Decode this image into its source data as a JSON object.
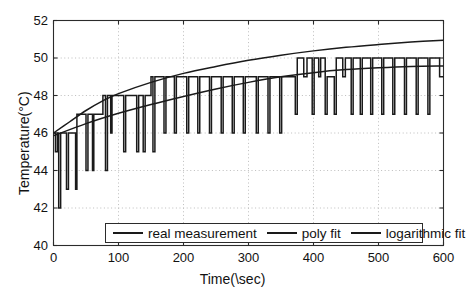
{
  "chart_data": {
    "type": "line",
    "title": "",
    "xlabel": "Time(\\sec)",
    "ylabel": "Temperature(°C)",
    "xlim": [
      0,
      600
    ],
    "ylim": [
      40,
      52
    ],
    "xticks": [
      "0",
      "100",
      "200",
      "300",
      "400",
      "500",
      "600"
    ],
    "xtick_values": [
      0,
      100,
      200,
      300,
      400,
      500,
      600
    ],
    "yticks": [
      "40",
      "42",
      "44",
      "46",
      "48",
      "50",
      "52"
    ],
    "ytick_values": [
      40,
      42,
      44,
      46,
      48,
      50,
      52
    ],
    "grid": "dotted both axes",
    "legend_position": "lower center inside axes",
    "series": [
      {
        "name": "real measurement",
        "color": "#1a1a1a",
        "style": "square-wave with downward spikes",
        "points": [
          [
            0,
            46.0
          ],
          [
            3,
            46.0
          ],
          [
            3,
            45.0
          ],
          [
            6,
            45.0
          ],
          [
            6,
            46.0
          ],
          [
            8,
            46.0
          ],
          [
            8,
            42.0
          ],
          [
            11,
            42.0
          ],
          [
            11,
            46.0
          ],
          [
            20,
            46.0
          ],
          [
            20,
            43.0
          ],
          [
            23,
            43.0
          ],
          [
            23,
            46.0
          ],
          [
            34,
            46.0
          ],
          [
            34,
            43.0
          ],
          [
            36,
            43.0
          ],
          [
            36,
            47.0
          ],
          [
            44,
            47.0
          ],
          [
            44,
            47.0
          ],
          [
            50,
            47.0
          ],
          [
            50,
            44.0
          ],
          [
            53,
            44.0
          ],
          [
            53,
            47.0
          ],
          [
            60,
            47.0
          ],
          [
            60,
            44.0
          ],
          [
            62,
            44.0
          ],
          [
            62,
            47.0
          ],
          [
            72,
            47.0
          ],
          [
            72,
            47.0
          ],
          [
            76,
            47.0
          ],
          [
            76,
            48.0
          ],
          [
            80,
            48.0
          ],
          [
            80,
            44.0
          ],
          [
            83,
            44.0
          ],
          [
            83,
            48.0
          ],
          [
            88,
            48.0
          ],
          [
            88,
            46.0
          ],
          [
            90,
            46.0
          ],
          [
            90,
            48.0
          ],
          [
            100,
            48.0
          ],
          [
            100,
            48.0
          ],
          [
            108,
            48.0
          ],
          [
            108,
            45.0
          ],
          [
            111,
            45.0
          ],
          [
            111,
            48.0
          ],
          [
            120,
            48.0
          ],
          [
            120,
            48.0
          ],
          [
            128,
            48.0
          ],
          [
            128,
            45.0
          ],
          [
            131,
            45.0
          ],
          [
            131,
            48.0
          ],
          [
            138,
            48.0
          ],
          [
            138,
            45.0
          ],
          [
            141,
            45.0
          ],
          [
            141,
            48.0
          ],
          [
            150,
            48.0
          ],
          [
            150,
            49.0
          ],
          [
            153,
            49.0
          ],
          [
            153,
            45.0
          ],
          [
            156,
            45.0
          ],
          [
            156,
            49.0
          ],
          [
            163,
            49.0
          ],
          [
            163,
            49.0
          ],
          [
            170,
            49.0
          ],
          [
            170,
            46.0
          ],
          [
            173,
            46.0
          ],
          [
            173,
            49.0
          ],
          [
            186,
            49.0
          ],
          [
            186,
            46.0
          ],
          [
            189,
            46.0
          ],
          [
            189,
            49.0
          ],
          [
            205,
            49.0
          ],
          [
            205,
            46.0
          ],
          [
            208,
            46.0
          ],
          [
            208,
            49.0
          ],
          [
            222,
            49.0
          ],
          [
            222,
            46.0
          ],
          [
            225,
            46.0
          ],
          [
            225,
            49.0
          ],
          [
            240,
            49.0
          ],
          [
            240,
            46.0
          ],
          [
            243,
            46.0
          ],
          [
            243,
            49.0
          ],
          [
            258,
            49.0
          ],
          [
            258,
            46.0
          ],
          [
            261,
            46.0
          ],
          [
            261,
            49.0
          ],
          [
            275,
            49.0
          ],
          [
            275,
            46.0
          ],
          [
            278,
            46.0
          ],
          [
            278,
            49.0
          ],
          [
            292,
            49.0
          ],
          [
            292,
            46.0
          ],
          [
            295,
            46.0
          ],
          [
            295,
            49.0
          ],
          [
            312,
            49.0
          ],
          [
            312,
            46.0
          ],
          [
            315,
            46.0
          ],
          [
            315,
            49.0
          ],
          [
            330,
            49.0
          ],
          [
            330,
            46.0
          ],
          [
            333,
            46.0
          ],
          [
            333,
            49.0
          ],
          [
            348,
            49.0
          ],
          [
            348,
            46.0
          ],
          [
            351,
            46.0
          ],
          [
            351,
            49.0
          ],
          [
            372,
            49.0
          ],
          [
            372,
            47.0
          ],
          [
            375,
            47.0
          ],
          [
            375,
            50.0
          ],
          [
            385,
            50.0
          ],
          [
            385,
            49.0
          ],
          [
            390,
            49.0
          ],
          [
            390,
            50.0
          ],
          [
            398,
            50.0
          ],
          [
            398,
            47.0
          ],
          [
            401,
            47.0
          ],
          [
            401,
            50.0
          ],
          [
            408,
            50.0
          ],
          [
            408,
            49.0
          ],
          [
            411,
            49.0
          ],
          [
            411,
            50.0
          ],
          [
            418,
            50.0
          ],
          [
            418,
            47.0
          ],
          [
            421,
            47.0
          ],
          [
            421,
            49.0
          ],
          [
            432,
            49.0
          ],
          [
            432,
            47.0
          ],
          [
            435,
            47.0
          ],
          [
            435,
            50.0
          ],
          [
            445,
            50.0
          ],
          [
            445,
            49.0
          ],
          [
            449,
            49.0
          ],
          [
            449,
            50.0
          ],
          [
            458,
            50.0
          ],
          [
            458,
            47.0
          ],
          [
            461,
            47.0
          ],
          [
            461,
            50.0
          ],
          [
            472,
            50.0
          ],
          [
            472,
            47.0
          ],
          [
            475,
            47.0
          ],
          [
            475,
            50.0
          ],
          [
            488,
            50.0
          ],
          [
            488,
            47.0
          ],
          [
            491,
            47.0
          ],
          [
            491,
            50.0
          ],
          [
            505,
            50.0
          ],
          [
            505,
            47.0
          ],
          [
            508,
            47.0
          ],
          [
            508,
            50.0
          ],
          [
            522,
            50.0
          ],
          [
            522,
            47.0
          ],
          [
            525,
            47.0
          ],
          [
            525,
            50.0
          ],
          [
            540,
            50.0
          ],
          [
            540,
            47.0
          ],
          [
            543,
            47.0
          ],
          [
            543,
            50.0
          ],
          [
            558,
            50.0
          ],
          [
            558,
            47.0
          ],
          [
            561,
            47.0
          ],
          [
            561,
            50.0
          ],
          [
            576,
            50.0
          ],
          [
            576,
            47.0
          ],
          [
            579,
            47.0
          ],
          [
            579,
            50.0
          ],
          [
            594,
            50.0
          ],
          [
            594,
            49.0
          ],
          [
            600,
            49.0
          ]
        ]
      },
      {
        "name": "poly fit",
        "color": "#1a1a1a",
        "style": "smooth near-linear",
        "points": [
          [
            0,
            45.85
          ],
          [
            50,
            46.5
          ],
          [
            100,
            47.05
          ],
          [
            150,
            47.52
          ],
          [
            200,
            47.95
          ],
          [
            250,
            48.35
          ],
          [
            300,
            48.7
          ],
          [
            350,
            49.0
          ],
          [
            400,
            49.22
          ],
          [
            450,
            49.38
          ],
          [
            500,
            49.48
          ],
          [
            550,
            49.55
          ],
          [
            600,
            49.58
          ]
        ]
      },
      {
        "name": "logarithmic fit",
        "color": "#1a1a1a",
        "style": "smooth logarithmic",
        "points": [
          [
            0,
            46.0
          ],
          [
            25,
            46.6
          ],
          [
            50,
            47.2
          ],
          [
            75,
            47.7
          ],
          [
            100,
            48.1
          ],
          [
            150,
            48.7
          ],
          [
            200,
            49.18
          ],
          [
            250,
            49.55
          ],
          [
            300,
            49.88
          ],
          [
            350,
            50.15
          ],
          [
            400,
            50.38
          ],
          [
            450,
            50.57
          ],
          [
            500,
            50.72
          ],
          [
            550,
            50.85
          ],
          [
            600,
            50.95
          ]
        ]
      }
    ]
  },
  "legend": {
    "items": [
      {
        "label": "real measurement"
      },
      {
        "label": "poly fit"
      },
      {
        "label": "logarithmic fit"
      }
    ]
  }
}
